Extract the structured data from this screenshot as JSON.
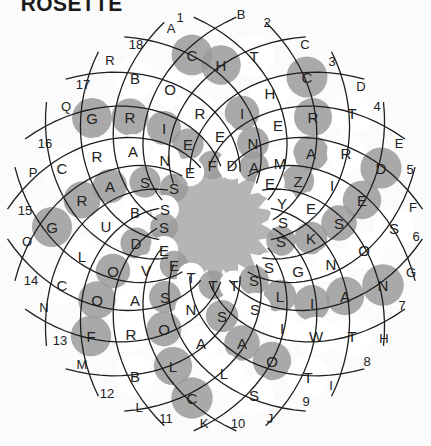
{
  "title": "ROSETTE",
  "colors": {
    "shade": "#9a9a9a",
    "light": "#ffffff",
    "center": "#b5b5b5",
    "line": "#1e1e1e"
  },
  "numbers": [
    {
      "t": "1",
      "x": 180,
      "y": 17
    },
    {
      "t": "2",
      "x": 267,
      "y": 22
    },
    {
      "t": "3",
      "x": 332,
      "y": 61
    },
    {
      "t": "4",
      "x": 377,
      "y": 106
    },
    {
      "t": "5",
      "x": 410,
      "y": 169
    },
    {
      "t": "6",
      "x": 416,
      "y": 236
    },
    {
      "t": "7",
      "x": 402,
      "y": 305
    },
    {
      "t": "8",
      "x": 367,
      "y": 361
    },
    {
      "t": "9",
      "x": 306,
      "y": 401
    },
    {
      "t": "10",
      "x": 238,
      "y": 423
    },
    {
      "t": "11",
      "x": 166,
      "y": 418
    },
    {
      "t": "12",
      "x": 107,
      "y": 393
    },
    {
      "t": "13",
      "x": 60,
      "y": 340
    },
    {
      "t": "14",
      "x": 31,
      "y": 280
    },
    {
      "t": "15",
      "x": 25,
      "y": 210
    },
    {
      "t": "16",
      "x": 45,
      "y": 143
    },
    {
      "t": "17",
      "x": 83,
      "y": 84
    },
    {
      "t": "18",
      "x": 136,
      "y": 44
    }
  ],
  "letters_labels": [
    {
      "t": "A",
      "x": 171,
      "y": 28
    },
    {
      "t": "B",
      "x": 241,
      "y": 14
    },
    {
      "t": "C",
      "x": 305,
      "y": 44
    },
    {
      "t": "D",
      "x": 361,
      "y": 86
    },
    {
      "t": "E",
      "x": 399,
      "y": 143
    },
    {
      "t": "F",
      "x": 413,
      "y": 207
    },
    {
      "t": "G",
      "x": 411,
      "y": 272
    },
    {
      "t": "H",
      "x": 384,
      "y": 338
    },
    {
      "t": "I",
      "x": 331,
      "y": 385
    },
    {
      "t": "J",
      "x": 270,
      "y": 418
    },
    {
      "t": "K",
      "x": 204,
      "y": 423
    },
    {
      "t": "L",
      "x": 139,
      "y": 407
    },
    {
      "t": "M",
      "x": 82,
      "y": 364
    },
    {
      "t": "N",
      "x": 44,
      "y": 307
    },
    {
      "t": "O",
      "x": 27,
      "y": 241
    },
    {
      "t": "P",
      "x": 33,
      "y": 172
    },
    {
      "t": "Q",
      "x": 66,
      "y": 106
    },
    {
      "t": "R",
      "x": 110,
      "y": 60
    }
  ],
  "cells": [
    {
      "l": "C",
      "x": 192,
      "y": 55,
      "s": 1
    },
    {
      "l": "T",
      "x": 254,
      "y": 56,
      "s": 0
    },
    {
      "l": "B",
      "x": 135,
      "y": 78,
      "s": 0
    },
    {
      "l": "O",
      "x": 170,
      "y": 89,
      "s": 0
    },
    {
      "l": "H",
      "x": 221,
      "y": 65,
      "s": 1
    },
    {
      "l": "H",
      "x": 270,
      "y": 93,
      "s": 0
    },
    {
      "l": "C",
      "x": 307,
      "y": 77,
      "s": 1
    },
    {
      "l": "T",
      "x": 352,
      "y": 113,
      "s": 0
    },
    {
      "l": "R",
      "x": 200,
      "y": 113,
      "s": 0
    },
    {
      "l": "I",
      "x": 242,
      "y": 113,
      "s": 1
    },
    {
      "l": "E",
      "x": 278,
      "y": 125,
      "s": 0
    },
    {
      "l": "R",
      "x": 313,
      "y": 117,
      "s": 1
    },
    {
      "l": "G",
      "x": 92,
      "y": 118,
      "s": 1
    },
    {
      "l": "R",
      "x": 130,
      "y": 117,
      "s": 1
    },
    {
      "l": "I",
      "x": 164,
      "y": 128,
      "s": 1
    },
    {
      "l": "E",
      "x": 188,
      "y": 144,
      "s": 1
    },
    {
      "l": "E",
      "x": 220,
      "y": 136,
      "s": 0
    },
    {
      "l": "N",
      "x": 253,
      "y": 143,
      "s": 1
    },
    {
      "l": "A",
      "x": 311,
      "y": 153,
      "s": 1
    },
    {
      "l": "R",
      "x": 346,
      "y": 153,
      "s": 0
    },
    {
      "l": "D",
      "x": 381,
      "y": 168,
      "s": 1
    },
    {
      "l": "C",
      "x": 62,
      "y": 168,
      "s": 0
    },
    {
      "l": "R",
      "x": 97,
      "y": 156,
      "s": 0
    },
    {
      "l": "A",
      "x": 133,
      "y": 151,
      "s": 0
    },
    {
      "l": "N",
      "x": 165,
      "y": 160,
      "s": 0
    },
    {
      "l": "F",
      "x": 212,
      "y": 165,
      "s": 1
    },
    {
      "l": "D",
      "x": 232,
      "y": 165,
      "s": 0
    },
    {
      "l": "M",
      "x": 280,
      "y": 163,
      "s": 0
    },
    {
      "l": "A",
      "x": 254,
      "y": 167,
      "s": 1
    },
    {
      "l": "E",
      "x": 190,
      "y": 172,
      "s": 0
    },
    {
      "l": "Z",
      "x": 298,
      "y": 181,
      "s": 1
    },
    {
      "l": "E",
      "x": 270,
      "y": 183,
      "s": 0
    },
    {
      "l": "I",
      "x": 332,
      "y": 185,
      "s": 0
    },
    {
      "l": "E",
      "x": 362,
      "y": 200,
      "s": 1
    },
    {
      "l": "R",
      "x": 82,
      "y": 200,
      "s": 1
    },
    {
      "l": "A",
      "x": 110,
      "y": 186,
      "s": 1
    },
    {
      "l": "S",
      "x": 145,
      "y": 182,
      "s": 1
    },
    {
      "l": "S",
      "x": 174,
      "y": 188,
      "s": 1
    },
    {
      "l": "Y",
      "x": 282,
      "y": 203,
      "s": 0
    },
    {
      "l": "E",
      "x": 311,
      "y": 208,
      "s": 0
    },
    {
      "l": "S",
      "x": 339,
      "y": 223,
      "s": 1
    },
    {
      "l": "S",
      "x": 394,
      "y": 228,
      "s": 0
    },
    {
      "l": "G",
      "x": 52,
      "y": 227,
      "s": 1
    },
    {
      "l": "U",
      "x": 106,
      "y": 226,
      "s": 0
    },
    {
      "l": "B",
      "x": 135,
      "y": 212,
      "s": 0
    },
    {
      "l": "S",
      "x": 165,
      "y": 209,
      "s": 0
    },
    {
      "l": "S",
      "x": 164,
      "y": 227,
      "s": 1
    },
    {
      "l": "S",
      "x": 283,
      "y": 222,
      "s": 0
    },
    {
      "l": "K",
      "x": 311,
      "y": 238,
      "s": 1
    },
    {
      "l": "O",
      "x": 364,
      "y": 250,
      "s": 0
    },
    {
      "l": "L",
      "x": 82,
      "y": 256,
      "s": 0
    },
    {
      "l": "D",
      "x": 136,
      "y": 243,
      "s": 1
    },
    {
      "l": "E",
      "x": 164,
      "y": 250,
      "s": 0
    },
    {
      "l": "S",
      "x": 281,
      "y": 241,
      "s": 1
    },
    {
      "l": "N",
      "x": 331,
      "y": 264,
      "s": 0
    },
    {
      "l": "G",
      "x": 298,
      "y": 271,
      "s": 0
    },
    {
      "l": "S",
      "x": 269,
      "y": 267,
      "s": 0
    },
    {
      "l": "N",
      "x": 383,
      "y": 285,
      "s": 1
    },
    {
      "l": "C",
      "x": 62,
      "y": 285,
      "s": 0
    },
    {
      "l": "O",
      "x": 113,
      "y": 271,
      "s": 1
    },
    {
      "l": "V",
      "x": 146,
      "y": 270,
      "s": 0
    },
    {
      "l": "E",
      "x": 174,
      "y": 265,
      "s": 1
    },
    {
      "l": "T",
      "x": 191,
      "y": 277,
      "s": 0
    },
    {
      "l": "T",
      "x": 213,
      "y": 285,
      "s": 1
    },
    {
      "l": "T",
      "x": 234,
      "y": 285,
      "s": 0
    },
    {
      "l": "S",
      "x": 254,
      "y": 280,
      "s": 1
    },
    {
      "l": "L",
      "x": 280,
      "y": 296,
      "s": 1
    },
    {
      "l": "I",
      "x": 312,
      "y": 303,
      "s": 1
    },
    {
      "l": "A",
      "x": 345,
      "y": 296,
      "s": 1
    },
    {
      "l": "O",
      "x": 97,
      "y": 300,
      "s": 1
    },
    {
      "l": "A",
      "x": 135,
      "y": 300,
      "s": 0
    },
    {
      "l": "S",
      "x": 165,
      "y": 297,
      "s": 1
    },
    {
      "l": "N",
      "x": 191,
      "y": 309,
      "s": 0
    },
    {
      "l": "S",
      "x": 222,
      "y": 316,
      "s": 1
    },
    {
      "l": "S",
      "x": 255,
      "y": 309,
      "s": 0
    },
    {
      "l": "I",
      "x": 282,
      "y": 328,
      "s": 0
    },
    {
      "l": "W",
      "x": 316,
      "y": 336,
      "s": 0
    },
    {
      "l": "T",
      "x": 352,
      "y": 336,
      "s": 0
    },
    {
      "l": "F",
      "x": 91,
      "y": 336,
      "s": 1
    },
    {
      "l": "R",
      "x": 131,
      "y": 334,
      "s": 0
    },
    {
      "l": "O",
      "x": 164,
      "y": 329,
      "s": 1
    },
    {
      "l": "A",
      "x": 201,
      "y": 343,
      "s": 0
    },
    {
      "l": "A",
      "x": 242,
      "y": 343,
      "s": 1
    },
    {
      "l": "O",
      "x": 272,
      "y": 361,
      "s": 1
    },
    {
      "l": "T",
      "x": 308,
      "y": 377,
      "s": 0
    },
    {
      "l": "B",
      "x": 135,
      "y": 376,
      "s": 0
    },
    {
      "l": "L",
      "x": 173,
      "y": 366,
      "s": 1
    },
    {
      "l": "L",
      "x": 224,
      "y": 373,
      "s": 0
    },
    {
      "l": "C",
      "x": 192,
      "y": 398,
      "s": 1
    },
    {
      "l": "S",
      "x": 254,
      "y": 395,
      "s": 0
    }
  ]
}
